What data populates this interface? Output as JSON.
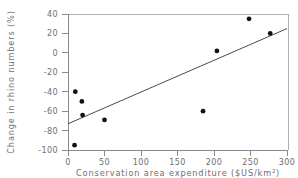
{
  "chart_data": {
    "type": "scatter",
    "title": "",
    "xlabel": "Conservation area expenditure ($US/km2)",
    "xlabel_base": "Conservation area expenditure ($US/km",
    "xlabel_sup": "2",
    "xlabel_tail": ")",
    "ylabel": "Change in rhino numbers (%)",
    "xlim": [
      0,
      300
    ],
    "ylim": [
      -100,
      40
    ],
    "xticks": [
      0,
      50,
      100,
      150,
      200,
      250,
      300
    ],
    "xtick_labels": [
      "0",
      "50",
      "100",
      "150",
      "200",
      "250",
      "300"
    ],
    "yticks": [
      40,
      20,
      0,
      -20,
      -40,
      -60,
      -80,
      -100
    ],
    "ytick_labels": [
      "40",
      "20",
      "0",
      "-20",
      "-40",
      "-60",
      "-80",
      "-100"
    ],
    "grid": false,
    "legend": null,
    "marker": "filled-circle",
    "marker_color": "#111111",
    "points": [
      {
        "x": 9,
        "y": -95
      },
      {
        "x": 10,
        "y": -40
      },
      {
        "x": 19,
        "y": -50
      },
      {
        "x": 20,
        "y": -64
      },
      {
        "x": 50,
        "y": -69
      },
      {
        "x": 185,
        "y": -60
      },
      {
        "x": 204,
        "y": 2
      },
      {
        "x": 248,
        "y": 35
      },
      {
        "x": 277,
        "y": 20
      }
    ],
    "trend_line": {
      "type": "linear-fit",
      "x_start": 0,
      "y_start": -73,
      "x_end": 300,
      "y_end": 25,
      "color": "#4a4a4a"
    }
  },
  "colors": {
    "background": "#ffffff",
    "axis": "#8a8a8a",
    "frame": "#b0b0b0",
    "text": "#6e6e6e",
    "marker": "#111111",
    "trend": "#4a4a4a"
  }
}
